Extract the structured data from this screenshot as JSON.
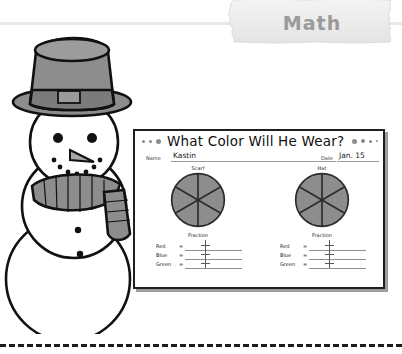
{
  "banner": {
    "label": "Math"
  },
  "worksheet": {
    "title": "What Color Will He Wear?",
    "fields": {
      "name_label": "Name",
      "name_value": "Kastin",
      "date_label": "Date",
      "date_value": "Jan. 15"
    },
    "panels": [
      {
        "heading": "Scarf",
        "fraction_heading": "Fraction",
        "rows": [
          {
            "label": "Red",
            "equals": "=",
            "value": ""
          },
          {
            "label": "Blue",
            "equals": "=",
            "value": ""
          },
          {
            "label": "Green",
            "equals": "=",
            "value": ""
          }
        ],
        "pie": {
          "slices": 6,
          "fills": [
            "#8a8a8a",
            "#949494",
            "#8f8f8f",
            "#828282",
            "#909090",
            "#8b8b8b"
          ]
        }
      },
      {
        "heading": "Hat",
        "fraction_heading": "Fraction",
        "rows": [
          {
            "label": "Red",
            "equals": "=",
            "value": ""
          },
          {
            "label": "Blue",
            "equals": "=",
            "value": ""
          },
          {
            "label": "Green",
            "equals": "=",
            "value": ""
          }
        ],
        "pie": {
          "slices": 6,
          "fills": [
            "#8a8a8a",
            "#949494",
            "#8f8f8f",
            "#828282",
            "#909090",
            "#8b8b8b"
          ]
        }
      }
    ]
  },
  "illustration": {
    "subject": "snowman-with-top-hat-and-scarf"
  },
  "colors": {
    "banner_text": "#9a9a9a",
    "worksheet_border": "#1f1f1f",
    "pie_stroke": "#2b2b2b",
    "cut_line": "#1c1c1c"
  }
}
